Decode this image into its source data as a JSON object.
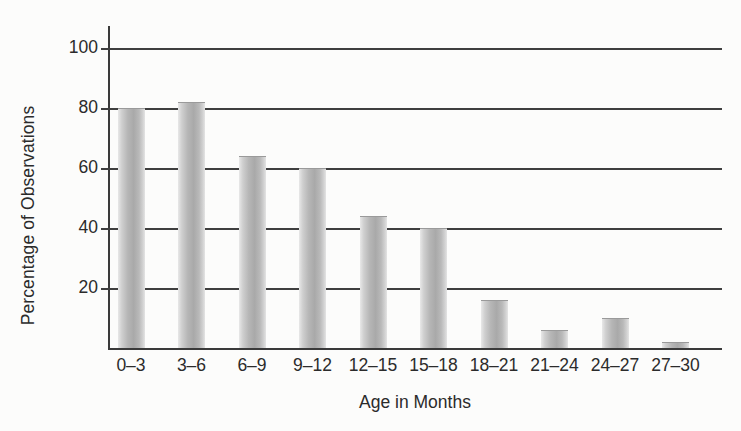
{
  "chart_data": {
    "type": "bar",
    "title": "",
    "xlabel": "Age in Months",
    "ylabel": "Percentage of Observations",
    "categories": [
      "0–3",
      "3–6",
      "6–9",
      "9–12",
      "12–15",
      "15–18",
      "18–21",
      "21–24",
      "24–27",
      "27–30"
    ],
    "values": [
      80,
      82,
      64,
      60,
      44,
      40,
      16,
      6,
      10,
      2
    ],
    "ylim": [
      0,
      100
    ],
    "ytick_labels": [
      "100",
      "80",
      "60",
      "40",
      "20"
    ],
    "ytick_values": [
      100,
      80,
      60,
      40,
      20
    ],
    "grid": "horizontal",
    "legend": "none",
    "bar_color": "#b5b5b5",
    "axis_color": "#3a3a3a",
    "background_color": "#fcfcfb"
  }
}
